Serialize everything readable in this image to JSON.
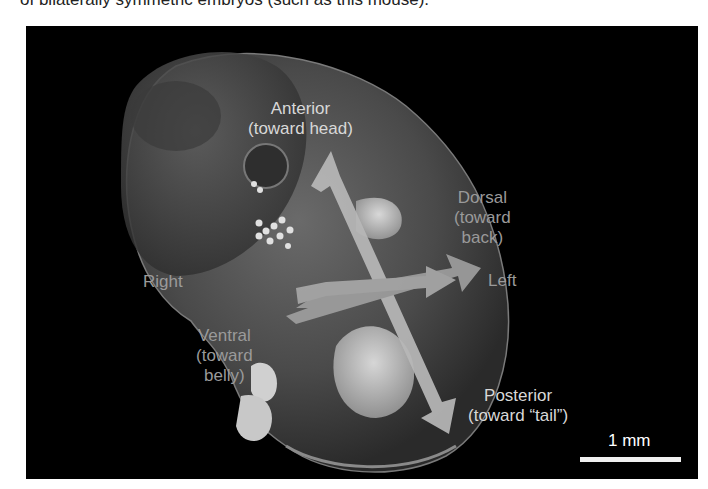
{
  "caption": {
    "partial_text": "of bilaterally symmetric embryos (such as this mouse)."
  },
  "figure": {
    "background_color": "#000000",
    "arrow_color": "#b8b8b8",
    "labels": {
      "anterior": {
        "line1": "Anterior",
        "line2": "(toward head)"
      },
      "dorsal": {
        "line1": "Dorsal",
        "line2": "(toward",
        "line3": "back)"
      },
      "left": {
        "line1": "Left"
      },
      "right": {
        "line1": "Right"
      },
      "ventral": {
        "line1": "Ventral",
        "line2": "(toward",
        "line3": "belly)"
      },
      "posterior": {
        "line1": "Posterior",
        "line2": "(toward “tail”)"
      }
    },
    "scale_bar": {
      "label": "1 mm"
    }
  }
}
